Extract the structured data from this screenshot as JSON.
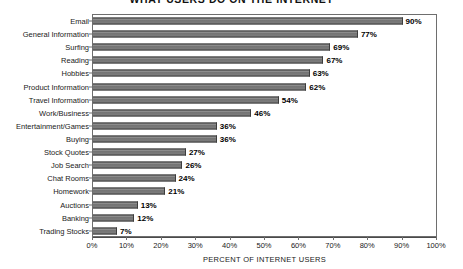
{
  "chart_data": {
    "type": "bar",
    "orientation": "horizontal",
    "title": "WHAT USERS DO ON THE INTERNET",
    "xlabel": "PERCENT OF INTERNET USERS",
    "ylabel": "",
    "xlim": [
      0,
      100
    ],
    "xtick_labels": [
      "0%",
      "10%",
      "20%",
      "30%",
      "40%",
      "50%",
      "60%",
      "70%",
      "80%",
      "90%",
      "100%"
    ],
    "xtick_values": [
      0,
      10,
      20,
      30,
      40,
      50,
      60,
      70,
      80,
      90,
      100
    ],
    "grid": false,
    "legend": "none",
    "bar_color": "#808080",
    "bar_edge_color": "#3d3d3d",
    "categories": [
      "Email",
      "General Information",
      "Surfing",
      "Reading",
      "Hobbies",
      "Product Information",
      "Travel Information",
      "Work/Business",
      "Entertainment/Games",
      "Buying",
      "Stock Quotes",
      "Job Search",
      "Chat Rooms",
      "Homework",
      "Auctions",
      "Banking",
      "Trading Stocks"
    ],
    "values": [
      90,
      77,
      69,
      67,
      63,
      62,
      54,
      46,
      36,
      36,
      27,
      26,
      24,
      21,
      13,
      12,
      7
    ],
    "value_labels": [
      "90%",
      "77%",
      "69%",
      "67%",
      "63%",
      "62%",
      "54%",
      "46%",
      "36%",
      "36%",
      "27%",
      "26%",
      "24%",
      "21%",
      "13%",
      "12%",
      "7%"
    ]
  }
}
